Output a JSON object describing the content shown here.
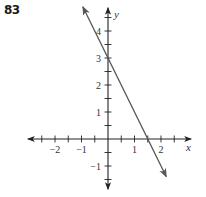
{
  "problem": {
    "number": "83"
  },
  "chart_data": {
    "type": "line",
    "title": "",
    "xlabel": "x",
    "ylabel": "y",
    "xlim": [
      -3.1,
      3.1
    ],
    "ylim": [
      -1.9,
      4.9
    ],
    "grid": false,
    "x_ticks": [
      -2.5,
      -2,
      -1.5,
      -1,
      -0.5,
      0.5,
      1,
      1.5,
      2,
      2.5
    ],
    "x_tick_labels": [
      {
        "value": -2,
        "label": "−2"
      },
      {
        "value": -1,
        "label": "−1"
      },
      {
        "value": 1,
        "label": "1"
      },
      {
        "value": 2,
        "label": "2"
      }
    ],
    "y_ticks": [
      -1.5,
      -1,
      -0.5,
      0.5,
      1,
      1.5,
      2,
      2.5,
      3,
      3.5,
      4,
      4.5
    ],
    "y_tick_labels": [
      {
        "value": 4,
        "label": "4"
      },
      {
        "value": 3,
        "label": "3"
      },
      {
        "value": 2,
        "label": "2"
      },
      {
        "value": 1,
        "label": "1"
      },
      {
        "value": -1,
        "label": "−1"
      }
    ],
    "series": [
      {
        "name": "y = -2x + 3",
        "equation": "y = -2x + 3",
        "x": [
          -0.95,
          2.2
        ],
        "y": [
          4.9,
          -1.4
        ],
        "arrows": "both",
        "color": "#555555"
      }
    ],
    "key_points": [
      {
        "label": "y-intercept",
        "x": 0,
        "y": 3
      },
      {
        "label": "x-intercept",
        "x": 1.5,
        "y": 0
      }
    ]
  },
  "colors": {
    "axis": "#222222",
    "line": "#555555",
    "text": "#333333"
  }
}
